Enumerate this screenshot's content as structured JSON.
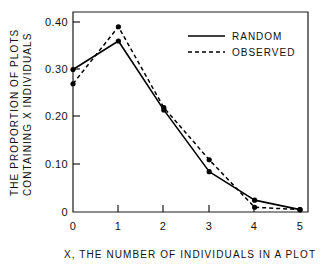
{
  "chart_data": {
    "type": "line",
    "title": "",
    "xlabel": "X, THE NUMBER OF INDIVIDUALS IN A PLOT",
    "ylabel_line1": "THE PROPORTION OF PLOTS",
    "ylabel_line2": "CONTAINING X INDIVIDUALS",
    "x": [
      0,
      1,
      2,
      3,
      4,
      5
    ],
    "xlim": [
      0,
      5
    ],
    "ylim": [
      0,
      0.4
    ],
    "grid": false,
    "legend_position": "top-right",
    "xticks": [
      "0",
      "1",
      "2",
      "3",
      "4",
      "5"
    ],
    "yticks": [
      "0",
      "0.10",
      "0.20",
      "0.30",
      "0.40"
    ],
    "ytick_values": [
      0,
      0.1,
      0.2,
      0.3,
      0.4
    ],
    "series": [
      {
        "name": "RANDOM",
        "style": "solid",
        "values": [
          0.3,
          0.36,
          0.215,
          0.085,
          0.025,
          0.005
        ]
      },
      {
        "name": "OBSERVED",
        "style": "dashed",
        "values": [
          0.27,
          0.39,
          0.22,
          0.11,
          0.01,
          0.005
        ]
      }
    ]
  },
  "legend": {
    "entries": [
      {
        "label": "RANDOM",
        "style": "solid"
      },
      {
        "label": "OBSERVED",
        "style": "dashed"
      }
    ]
  }
}
